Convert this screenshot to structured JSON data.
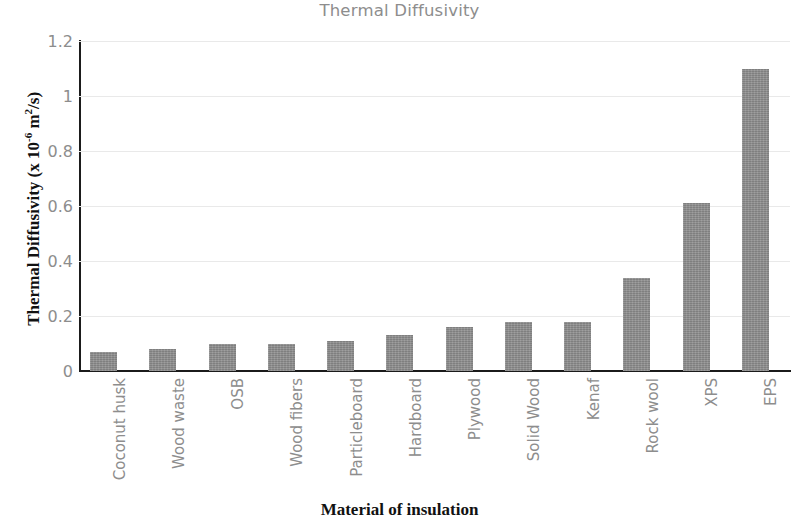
{
  "chart_data": {
    "type": "bar",
    "title": "Thermal Diffusivity",
    "xlabel": "Material of insulation",
    "ylabel": "Thermal Diffusivity (x 10-6 m2/s)",
    "ylabel_parts": {
      "prefix": "Thermal Diffusivity (x 10",
      "exp1": "-6",
      "mid": " m",
      "exp2": "2",
      "suffix": "/s)"
    },
    "categories": [
      "Coconut husk",
      "Wood waste",
      "OSB",
      "Wood fibers",
      "Particleboard",
      "Hardboard",
      "Plywood",
      "Solid Wood",
      "Kenaf",
      "Rock wool",
      "XPS",
      "EPS"
    ],
    "values": [
      0.07,
      0.08,
      0.1,
      0.1,
      0.11,
      0.13,
      0.16,
      0.18,
      0.18,
      0.34,
      0.61,
      1.1
    ],
    "ylim": [
      0,
      1.2
    ],
    "yticks": [
      "0",
      "0.2",
      "0.4",
      "0.6",
      "0.8",
      "1",
      "1.2"
    ],
    "ytick_values": [
      0,
      0.2,
      0.4,
      0.6,
      0.8,
      1.0,
      1.2
    ],
    "grid": true,
    "legend": false,
    "bar_color": "#8c8c8c",
    "title_color": "#8d8d8d",
    "tick_color": "#8d8d8d",
    "axis_color": "#1b1b1b",
    "gridline_color": "#e9e9e9"
  }
}
